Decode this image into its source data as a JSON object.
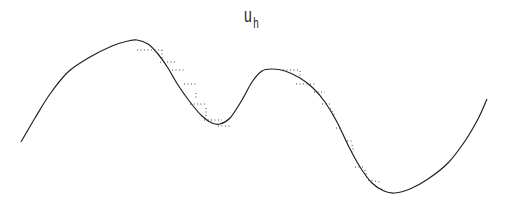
{
  "title": {
    "main": "u",
    "subscript": "h"
  },
  "chart_data": {
    "type": "line",
    "xlabel": "",
    "ylabel": "",
    "grid": false,
    "axes_visible": false,
    "legend": null,
    "series": [
      {
        "name": "smooth solution",
        "style": "solid",
        "color": "#222222",
        "points_px": [
          [
            21,
            142
          ],
          [
            35,
            118
          ],
          [
            50,
            94
          ],
          [
            68,
            72
          ],
          [
            90,
            57
          ],
          [
            112,
            46
          ],
          [
            128,
            41
          ],
          [
            137,
            40
          ],
          [
            148,
            44
          ],
          [
            158,
            54
          ],
          [
            168,
            68
          ],
          [
            178,
            85
          ],
          [
            190,
            102
          ],
          [
            202,
            116
          ],
          [
            212,
            123
          ],
          [
            220,
            124
          ],
          [
            230,
            118
          ],
          [
            242,
            100
          ],
          [
            252,
            82
          ],
          [
            262,
            71
          ],
          [
            272,
            69
          ],
          [
            285,
            71
          ],
          [
            300,
            78
          ],
          [
            313,
            88
          ],
          [
            325,
            102
          ],
          [
            337,
            122
          ],
          [
            348,
            145
          ],
          [
            360,
            167
          ],
          [
            372,
            183
          ],
          [
            384,
            191
          ],
          [
            395,
            193
          ],
          [
            410,
            189
          ],
          [
            428,
            179
          ],
          [
            448,
            163
          ],
          [
            465,
            141
          ],
          [
            478,
            119
          ],
          [
            487,
            99
          ]
        ]
      },
      {
        "name": "piecewise approximation",
        "style": "dotted",
        "color": "#444444",
        "segments_px": [
          [
            [
              137,
              50
            ],
            [
              162,
              50
            ]
          ],
          [
            [
              162,
              50
            ],
            [
              162,
              58
            ]
          ],
          [
            [
              160,
              62
            ],
            [
              175,
              62
            ]
          ],
          [
            [
              172,
              70
            ],
            [
              186,
              70
            ]
          ],
          [
            [
              184,
              84
            ],
            [
              198,
              84
            ]
          ],
          [
            [
              196,
              93
            ],
            [
              196,
              100
            ]
          ],
          [
            [
              190,
              104
            ],
            [
              206,
              104
            ]
          ],
          [
            [
              206,
              108
            ],
            [
              206,
              118
            ]
          ],
          [
            [
              204,
              120
            ],
            [
              222,
              120
            ]
          ],
          [
            [
              218,
              126
            ],
            [
              232,
              126
            ]
          ],
          [
            [
              283,
              70
            ],
            [
              300,
              70
            ]
          ],
          [
            [
              300,
              71
            ],
            [
              300,
              78
            ]
          ],
          [
            [
              296,
              84
            ],
            [
              316,
              84
            ]
          ],
          [
            [
              314,
              92
            ],
            [
              325,
              92
            ]
          ],
          [
            [
              322,
              104
            ],
            [
              330,
              104
            ]
          ],
          [
            [
              330,
              108
            ],
            [
              335,
              116
            ]
          ],
          [
            [
              336,
              128
            ],
            [
              343,
              128
            ]
          ],
          [
            [
              347,
              141
            ],
            [
              352,
              141
            ]
          ],
          [
            [
              352,
              145
            ],
            [
              354,
              152
            ]
          ],
          [
            [
              355,
              167
            ],
            [
              365,
              167
            ]
          ],
          [
            [
              365,
              170
            ],
            [
              367,
              178
            ]
          ],
          [
            [
              368,
              180
            ],
            [
              380,
              182
            ]
          ],
          [
            [
              378,
              188
            ],
            [
              385,
              190
            ]
          ]
        ]
      }
    ],
    "xlim_px": [
      21,
      487
    ],
    "ylim_px": [
      40,
      193
    ]
  }
}
